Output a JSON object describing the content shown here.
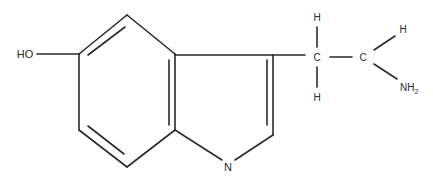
{
  "molecule": {
    "name": "Serotonin (5-hydroxytryptamine)",
    "line_color": "#2a2a2a",
    "background": "#ffffff",
    "atoms": {
      "hydroxyl": {
        "label": "HO",
        "x": 25,
        "y": 58
      },
      "ring_nitrogen": {
        "label": "N",
        "x": 228,
        "y": 171
      },
      "side_chain_c1": {
        "label": "C",
        "x": 317,
        "y": 61
      },
      "side_chain_c1_h_top": {
        "label": "H",
        "x": 317,
        "y": 21
      },
      "side_chain_c1_h_bottom": {
        "label": "H",
        "x": 317,
        "y": 101
      },
      "side_chain_c2": {
        "label": "C",
        "x": 363,
        "y": 61
      },
      "side_chain_c2_h": {
        "label": "H",
        "x": 403,
        "y": 33
      },
      "amine": {
        "label": "NH",
        "subscript": "2",
        "x": 400,
        "y": 91
      }
    },
    "bonds": [
      {
        "id": "ho-c5",
        "x1": 37,
        "y1": 54,
        "x2": 79,
        "y2": 54
      },
      {
        "id": "c5-c4",
        "x1": 79,
        "y1": 54,
        "x2": 127,
        "y2": 15
      },
      {
        "id": "c4-c4a",
        "x1": 127,
        "y1": 15,
        "x2": 175,
        "y2": 54
      },
      {
        "id": "c4a-c7a",
        "x1": 175,
        "y1": 54,
        "x2": 175,
        "y2": 130
      },
      {
        "id": "c7a-c7",
        "x1": 175,
        "y1": 130,
        "x2": 127,
        "y2": 167
      },
      {
        "id": "c7-c6",
        "x1": 127,
        "y1": 167,
        "x2": 79,
        "y2": 130
      },
      {
        "id": "c6-c5",
        "x1": 79,
        "y1": 130,
        "x2": 79,
        "y2": 54
      },
      {
        "id": "c5-c4-inner",
        "x1": 88,
        "y1": 55,
        "x2": 125,
        "y2": 27
      },
      {
        "id": "c4a-c7a-inner",
        "x1": 169,
        "y1": 60,
        "x2": 169,
        "y2": 125
      },
      {
        "id": "c7-c6-inner",
        "x1": 88,
        "y1": 126,
        "x2": 124,
        "y2": 154
      },
      {
        "id": "c4a-c3",
        "x1": 175,
        "y1": 55,
        "x2": 273,
        "y2": 55
      },
      {
        "id": "c3-c2",
        "x1": 273,
        "y1": 55,
        "x2": 273,
        "y2": 135
      },
      {
        "id": "c3-c2-inner",
        "x1": 267,
        "y1": 60,
        "x2": 267,
        "y2": 125
      },
      {
        "id": "c7a-n",
        "x1": 175,
        "y1": 130,
        "x2": 222,
        "y2": 160
      },
      {
        "id": "n-c2",
        "x1": 235,
        "y1": 160,
        "x2": 273,
        "y2": 135
      },
      {
        "id": "c3-ca",
        "x1": 273,
        "y1": 55,
        "x2": 305,
        "y2": 55
      },
      {
        "id": "ca-h-top",
        "x1": 317,
        "y1": 27,
        "x2": 317,
        "y2": 47
      },
      {
        "id": "ca-h-bottom",
        "x1": 317,
        "y1": 67,
        "x2": 317,
        "y2": 87
      },
      {
        "id": "ca-cb",
        "x1": 330,
        "y1": 57,
        "x2": 352,
        "y2": 57
      },
      {
        "id": "cb-h",
        "x1": 374,
        "y1": 50,
        "x2": 395,
        "y2": 36
      },
      {
        "id": "cb-nh2",
        "x1": 374,
        "y1": 64,
        "x2": 397,
        "y2": 79
      }
    ]
  }
}
